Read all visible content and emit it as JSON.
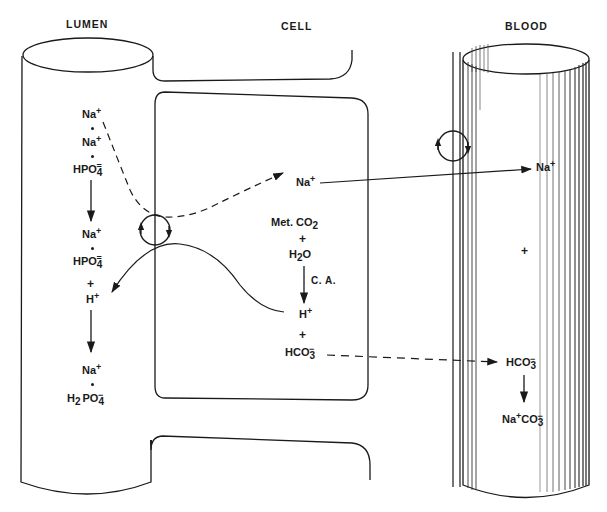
{
  "labels": {
    "lumen": "LUMEN",
    "cell": "CELL",
    "blood": "BLOOD"
  },
  "lumen": {
    "species_top": [
      {
        "base": "Na",
        "sup": "+"
      },
      {
        "base": "Na",
        "sup": "+"
      },
      {
        "base": "HPO",
        "sub": "4",
        "sup": "="
      }
    ],
    "species_mid": [
      {
        "base": "Na",
        "sup": "+"
      },
      {
        "base": "HPO",
        "sub": "4",
        "sup": "="
      }
    ],
    "plus": "+",
    "h_ion": {
      "base": "H",
      "sup": "+"
    },
    "species_bottom": [
      {
        "base": "Na",
        "sup": "+"
      },
      {
        "pre": "H",
        "pre_sub": "2",
        "base": "PO",
        "sub": "4",
        "sup": "−"
      }
    ]
  },
  "cell": {
    "na_ion": {
      "base": "Na",
      "sup": "+"
    },
    "reaction": {
      "reactant1": "Met. CO",
      "reactant1_sub": "2",
      "plus1": "+",
      "reactant2_pre": "H",
      "reactant2_sub": "2",
      "reactant2_post": "O",
      "enzyme": "C. A.",
      "product1": "H",
      "product1_sup": "+",
      "plus2": "+",
      "product2": "HCO",
      "product2_sub": "3",
      "product2_sup": "−"
    }
  },
  "blood": {
    "na_ion": {
      "base": "Na",
      "sup": "+"
    },
    "plus": "+",
    "bicarbonate": {
      "base": "HCO",
      "sub": "3",
      "sup": "−"
    },
    "product": {
      "base": "Na",
      "sup": "+",
      "post": "CO",
      "sub": "3",
      "sup2": "−"
    }
  },
  "pathways": [
    {
      "name": "na-lumen-to-cell",
      "style": "dashed",
      "from": "lumen Na+·Na+·HPO4=",
      "to": "cell Na+",
      "via": "luminal exchanger"
    },
    {
      "name": "na-cell-to-blood",
      "style": "solid",
      "from": "cell Na+",
      "to": "blood Na+",
      "via": "basolateral pump"
    },
    {
      "name": "h-cell-to-lumen",
      "style": "solid",
      "from": "cell H+",
      "to": "lumen H+",
      "via": "luminal exchanger"
    },
    {
      "name": "hco3-cell-to-blood",
      "style": "dashed",
      "from": "cell HCO3-",
      "to": "blood HCO3-"
    }
  ]
}
